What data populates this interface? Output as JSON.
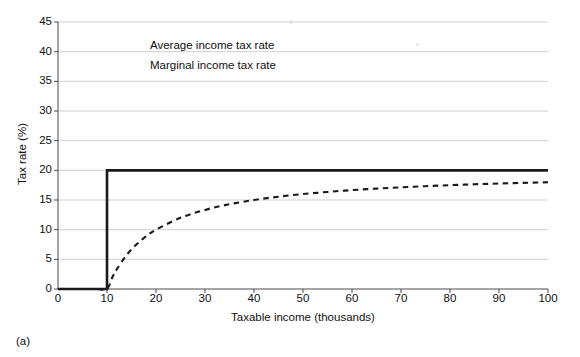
{
  "caption": "(a)",
  "chart_data": {
    "type": "line",
    "title": "",
    "xlabel": "Taxable income (thousands)",
    "ylabel": "Tax rate (%)",
    "xlim": [
      0,
      100
    ],
    "ylim": [
      0,
      45
    ],
    "xticks": [
      0,
      10,
      20,
      30,
      40,
      50,
      60,
      70,
      80,
      90,
      100
    ],
    "yticks": [
      0,
      5,
      10,
      15,
      20,
      25,
      30,
      35,
      40,
      45
    ],
    "grid": "horizontal",
    "legend_position": "upper-left-inside",
    "exemption_threshold": 10,
    "statutory_rate": 20,
    "series": [
      {
        "name": "Average income tax rate",
        "style": "dashed",
        "color": "#1a1a1a",
        "x": [
          0,
          2,
          4,
          6,
          8,
          10,
          11,
          12,
          14,
          16,
          18,
          20,
          25,
          30,
          35,
          40,
          45,
          50,
          55,
          60,
          65,
          70,
          75,
          80,
          85,
          90,
          95,
          100
        ],
        "values": [
          0,
          0,
          0,
          0,
          0,
          0,
          1.82,
          3.33,
          5.71,
          7.5,
          8.89,
          10,
          12,
          13.33,
          14.29,
          15,
          15.56,
          16,
          16.36,
          16.67,
          16.92,
          17.14,
          17.33,
          17.5,
          17.65,
          17.78,
          17.89,
          18
        ]
      },
      {
        "name": "Marginal income tax rate",
        "style": "solid",
        "color": "#1a1a1a",
        "x": [
          0,
          10,
          10,
          100
        ],
        "values": [
          0,
          0,
          20,
          20
        ]
      }
    ]
  }
}
